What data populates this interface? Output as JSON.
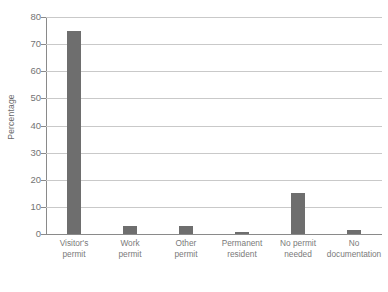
{
  "chart_data": {
    "type": "bar",
    "title": "",
    "subtitle": "",
    "xlabel": "",
    "ylabel": "Percentage",
    "categories": [
      "Visitor's\npermit",
      "Work\npermit",
      "Other\npermit",
      "Permanent\nresident",
      "No permit\nneeded",
      "No\ndocumentation"
    ],
    "values": [
      75,
      3,
      3,
      0.7,
      15,
      1.5
    ],
    "ylim": [
      0,
      80
    ],
    "yticks": [
      0,
      10,
      20,
      30,
      40,
      50,
      60,
      70,
      80
    ],
    "ytick_labels": [
      "0",
      "10",
      "20",
      "30",
      "40",
      "50",
      "60",
      "70",
      "80"
    ],
    "grid": true,
    "legend": false,
    "legend_position": "none",
    "colors": {
      "bar": "#6e6e6e",
      "gridline": "#c9c9c9",
      "axis": "#8a8a8a",
      "tick_text": "#747474",
      "label_text": "#7a7a7a",
      "background": "#ffffff"
    }
  }
}
